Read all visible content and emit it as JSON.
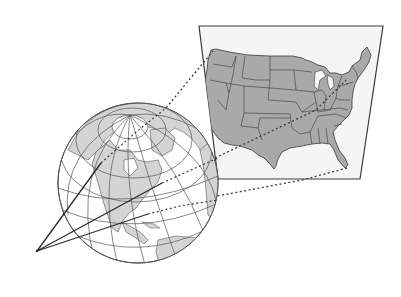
{
  "diagram": {
    "colors": {
      "background": "#ffffff",
      "ocean": "#ffffff",
      "land_globe": "#d4d4d4",
      "land_map": "#a9a9a9",
      "panel_fill": "#f5f5f5",
      "outline": "#3a3a3a",
      "graticule": "#555555"
    },
    "elements": {
      "globe": {
        "label": "Globe",
        "cx": 138,
        "cy": 183,
        "r": 80
      },
      "map_panel": {
        "label": "Flat map of the contiguous United States",
        "corners": [
          [
            199,
            26
          ],
          [
            383,
            26
          ],
          [
            360,
            179
          ],
          [
            218,
            179
          ]
        ]
      },
      "viewpoint": {
        "label": "Viewpoint",
        "x": 37,
        "y": 251
      },
      "projection_lines": {
        "label": "Projection lines",
        "count": 3,
        "style": "dotted"
      }
    }
  }
}
